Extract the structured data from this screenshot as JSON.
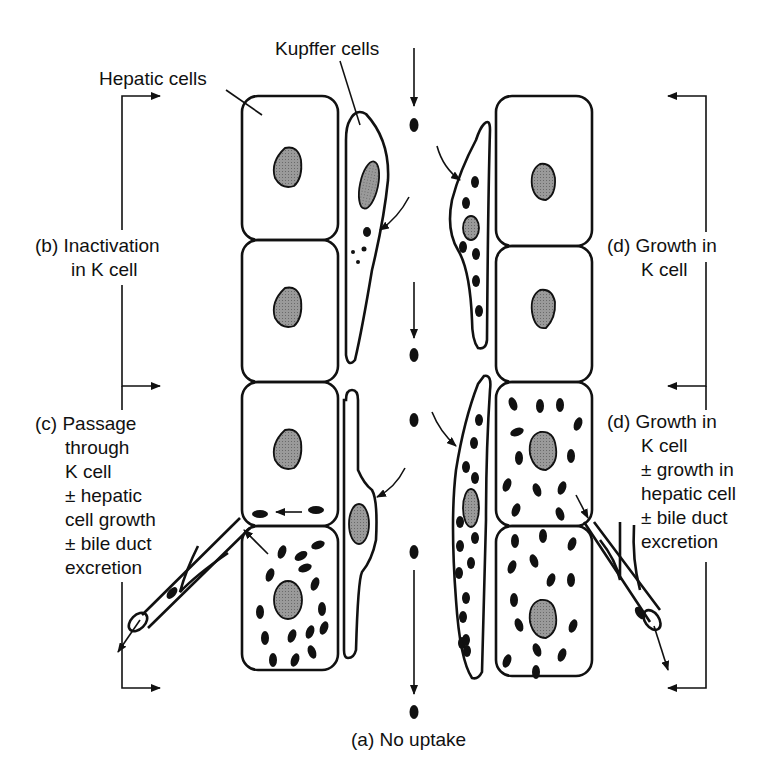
{
  "figure": {
    "labels": {
      "hepatic_cells": "Hepatic cells",
      "kupffer_cells": "Kupffer cells",
      "b_inactivation": [
        "(b) Inactivation",
        "in K cell"
      ],
      "c_passage": [
        "(c) Passage",
        "through",
        "K cell",
        "± hepatic",
        "cell growth",
        "± bile duct",
        "excretion"
      ],
      "d_growth_top": [
        "(d) Growth in",
        "K cell"
      ],
      "d_growth_bottom": [
        "(d) Growth in",
        "K cell",
        "± growth in",
        "hepatic cell",
        "± bile duct",
        "excretion"
      ],
      "a_no_uptake": "(a) No uptake"
    },
    "colors": {
      "line": "#111111",
      "nucleus": "#8a8a8a",
      "particle": "#111111",
      "background": "#ffffff"
    }
  }
}
